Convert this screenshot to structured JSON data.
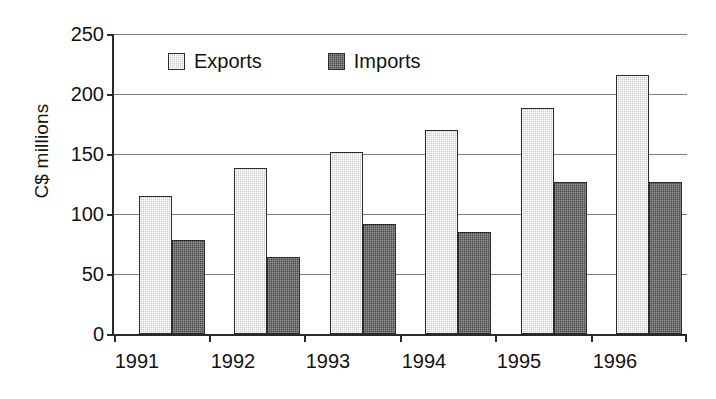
{
  "chart_data": {
    "type": "bar",
    "title": "",
    "subtitle": "",
    "xlabel": "",
    "ylabel": "C$ millions",
    "categories": [
      "1991",
      "1992",
      "1993",
      "1994",
      "1995",
      "1996"
    ],
    "series": [
      {
        "name": "Exports",
        "values": [
          115,
          138,
          152,
          170,
          188,
          216
        ],
        "color": "#c6c6c6"
      },
      {
        "name": "Imports",
        "values": [
          78,
          64,
          92,
          85,
          127,
          127
        ],
        "color": "#4a4a4a"
      }
    ],
    "ylim": [
      0,
      250
    ],
    "yticks": [
      0,
      50,
      100,
      150,
      200,
      250
    ],
    "ytick_labels": [
      "0",
      "50",
      "100",
      "150",
      "200",
      "250"
    ],
    "grid": true,
    "grid_axis": "y",
    "legend_position": "top-center-inside",
    "annotations": []
  },
  "axes": {
    "y_title": "C$ millions",
    "y_tick_labels": [
      "250",
      "200",
      "150",
      "100",
      "50",
      "0"
    ],
    "x_tick_labels": [
      "1991",
      "1992",
      "1993",
      "1994",
      "1995",
      "1996"
    ]
  },
  "legend": {
    "entries": [
      {
        "label": "Exports",
        "swatch": "light-gray-swatch-icon"
      },
      {
        "label": "Imports",
        "swatch": "dark-gray-swatch-icon"
      }
    ]
  }
}
